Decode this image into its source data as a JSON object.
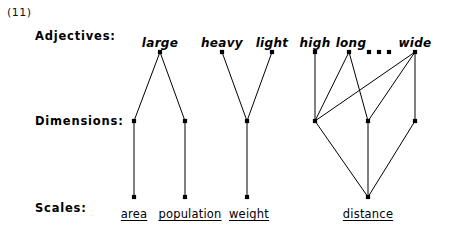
{
  "example": {
    "number": "(11)"
  },
  "rows": {
    "adjectives_label": "Adjectives:",
    "dimensions_label": "Dimensions:",
    "scales_label": "Scales:"
  },
  "layout": {
    "adjective_row_y": 52,
    "dimension_row_y": 121,
    "scale_row_y": 197,
    "node_radius": 2.1,
    "line_color": "#000000",
    "text_color": "#000000",
    "background": "#ffffff"
  },
  "adjectives": [
    {
      "id": "large",
      "label": "large",
      "x": 160,
      "label_x": 160,
      "label_y": 36
    },
    {
      "id": "heavy",
      "label": "heavy",
      "x": 222,
      "label_x": 222,
      "label_y": 36
    },
    {
      "id": "light",
      "label": "light",
      "x": 272,
      "label_x": 272,
      "label_y": 36
    },
    {
      "id": "high",
      "label": "high",
      "x": 315,
      "label_x": 315,
      "label_y": 36
    },
    {
      "id": "long",
      "label": "long",
      "x": 349,
      "label_x": 351,
      "label_y": 36
    },
    {
      "id": "wide",
      "label": "wide",
      "x": 415,
      "label_x": 415,
      "label_y": 36
    }
  ],
  "ellipsis": {
    "label": "...",
    "dots_x": [
      369,
      379,
      389
    ],
    "y": 52
  },
  "dimensions": [
    {
      "id": "dim-area",
      "x": 134
    },
    {
      "id": "dim-population",
      "x": 185
    },
    {
      "id": "dim-weight",
      "x": 247
    },
    {
      "id": "dim-distance-1",
      "x": 315
    },
    {
      "id": "dim-distance-2",
      "x": 368
    },
    {
      "id": "dim-distance-3",
      "x": 415
    }
  ],
  "scales": [
    {
      "id": "area",
      "label": "area",
      "x": 134,
      "label_x": 134,
      "label_y": 207
    },
    {
      "id": "population",
      "label": "population",
      "x": 185,
      "label_x": 190,
      "label_y": 207
    },
    {
      "id": "weight",
      "label": "weight",
      "x": 247,
      "label_x": 249,
      "label_y": 207
    },
    {
      "id": "distance",
      "label": "distance",
      "x": 368,
      "label_x": 368,
      "label_y": 207
    }
  ],
  "edges_adjective_to_dimension": [
    {
      "from": "large",
      "to": "dim-area",
      "x1": 160,
      "x2": 134
    },
    {
      "from": "large",
      "to": "dim-population",
      "x1": 160,
      "x2": 185
    },
    {
      "from": "heavy",
      "to": "dim-weight",
      "x1": 222,
      "x2": 247
    },
    {
      "from": "light",
      "to": "dim-weight",
      "x1": 272,
      "x2": 247
    },
    {
      "from": "high",
      "to": "dim-distance-1",
      "x1": 315,
      "x2": 315
    },
    {
      "from": "long",
      "to": "dim-distance-1",
      "x1": 349,
      "x2": 315
    },
    {
      "from": "long",
      "to": "dim-distance-2",
      "x1": 349,
      "x2": 368
    },
    {
      "from": "wide",
      "to": "dim-distance-1",
      "x1": 415,
      "x2": 315
    },
    {
      "from": "wide",
      "to": "dim-distance-2",
      "x1": 415,
      "x2": 368
    },
    {
      "from": "wide",
      "to": "dim-distance-3",
      "x1": 415,
      "x2": 415
    }
  ],
  "edges_dimension_to_scale": [
    {
      "from": "dim-area",
      "to": "area",
      "x1": 134,
      "x2": 134
    },
    {
      "from": "dim-population",
      "to": "population",
      "x1": 185,
      "x2": 185
    },
    {
      "from": "dim-weight",
      "to": "weight",
      "x1": 247,
      "x2": 247
    },
    {
      "from": "dim-distance-1",
      "to": "distance",
      "x1": 315,
      "x2": 368
    },
    {
      "from": "dim-distance-2",
      "to": "distance",
      "x1": 368,
      "x2": 368
    },
    {
      "from": "dim-distance-3",
      "to": "distance",
      "x1": 415,
      "x2": 368
    }
  ]
}
